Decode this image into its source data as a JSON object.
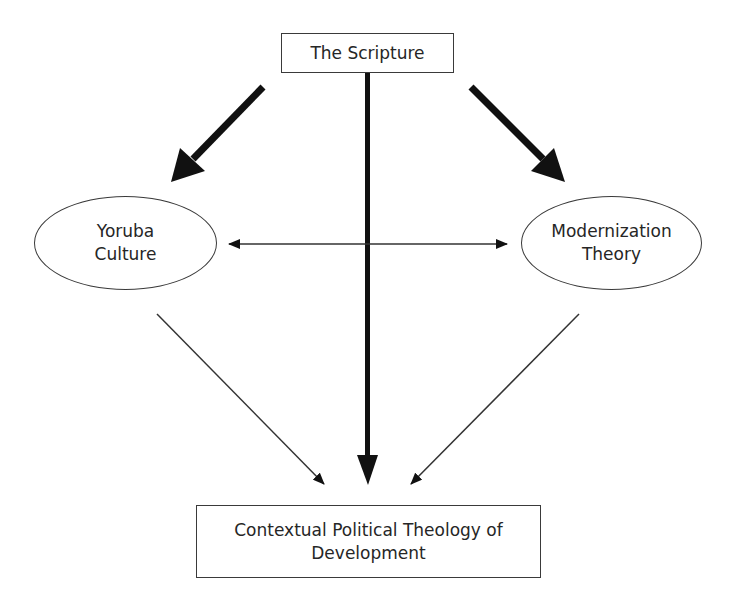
{
  "diagram": {
    "nodes": {
      "scripture": {
        "label": "The Scripture",
        "shape": "rectangle"
      },
      "yoruba": {
        "line1": "Yoruba",
        "line2": "Culture",
        "shape": "ellipse"
      },
      "modernization": {
        "line1": "Modernization",
        "line2": "Theory",
        "shape": "ellipse"
      },
      "result": {
        "line1": "Contextual Political Theology of",
        "line2": "Development",
        "shape": "rectangle"
      }
    },
    "edges": [
      {
        "from": "The Scripture",
        "to": "Yoruba Culture",
        "style": "thick"
      },
      {
        "from": "The Scripture",
        "to": "Modernization Theory",
        "style": "thick"
      },
      {
        "from": "The Scripture",
        "to": "Contextual Political Theology of Development",
        "style": "thick"
      },
      {
        "from": "Yoruba Culture",
        "to": "Modernization Theory",
        "style": "thin-bidirectional"
      },
      {
        "from": "Yoruba Culture",
        "to": "Contextual Political Theology of Development",
        "style": "thin"
      },
      {
        "from": "Modernization Theory",
        "to": "Contextual Political Theology of Development",
        "style": "thin"
      }
    ],
    "colors": {
      "line": "#111111",
      "thin_line": "#333333",
      "border": "#3a3a3a",
      "background": "#ffffff"
    }
  }
}
